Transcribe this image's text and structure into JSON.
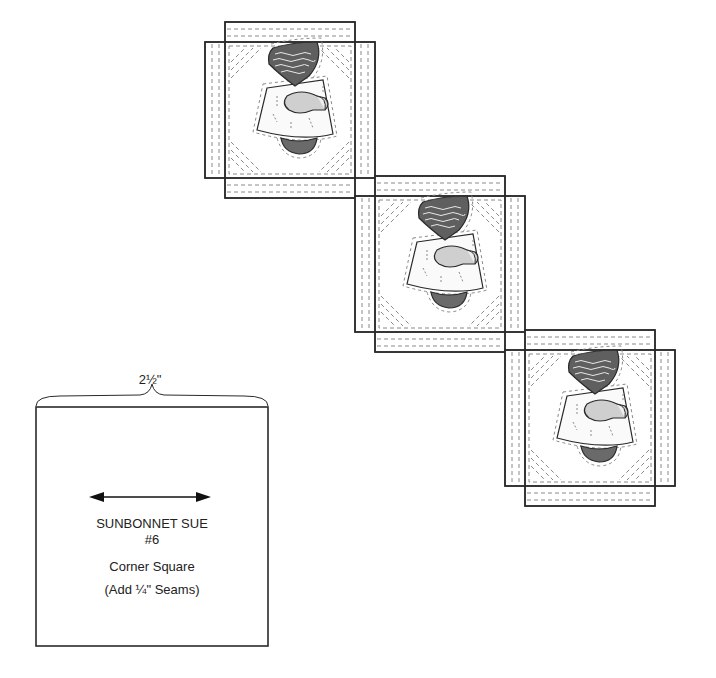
{
  "template": {
    "dimension_label": "2½\"",
    "title_line1": "SUNBONNET SUE",
    "title_line2": "#6",
    "piece_name": "Corner Square",
    "seam_note": "(Add ¼\" Seams)",
    "grain_arrow": "double-headed-arrow"
  },
  "blocks": [
    {
      "name": "sunbonnet-sue-block-1"
    },
    {
      "name": "sunbonnet-sue-block-2"
    },
    {
      "name": "sunbonnet-sue-block-3"
    }
  ],
  "colors": {
    "outline": "#2a2a2a",
    "stitch": "#8a8a8a",
    "bonnet": "#5f5f5f",
    "shoe": "#6a6a6a",
    "hand": "#cfcfcf",
    "background": "#ffffff"
  }
}
